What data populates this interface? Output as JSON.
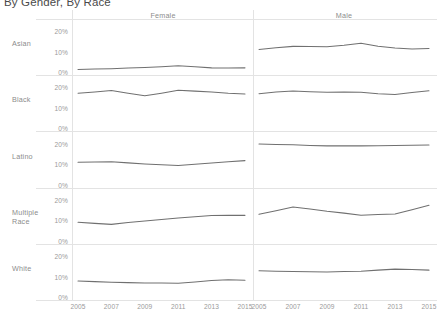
{
  "title": "By Gender, By Race",
  "axis": {
    "y_ticks": [
      "20%",
      "10%",
      "0%"
    ],
    "x_ticks": [
      "2005",
      "2007",
      "2009",
      "2011",
      "2013",
      "2015"
    ]
  },
  "columns": [
    {
      "label": "Female"
    },
    {
      "label": "Male"
    }
  ],
  "rows": [
    {
      "label": "Asian"
    },
    {
      "label": "Black"
    },
    {
      "label": "Latino"
    },
    {
      "label": "Multiple Race"
    },
    {
      "label": "White"
    }
  ],
  "chart_data": {
    "type": "line",
    "title": "By Gender, By Race",
    "xlabel": "",
    "ylabel": "",
    "ylim": [
      0,
      25
    ],
    "grid": false,
    "legend": null,
    "layout": {
      "kind": "small-multiples-trellis",
      "columns": [
        "Female",
        "Male"
      ],
      "rows": [
        "Asian",
        "Black",
        "Latino",
        "Multiple Race",
        "White"
      ],
      "y_tick_values": [
        0,
        10,
        20
      ],
      "y_tick_labels": [
        "0%",
        "10%",
        "20%"
      ],
      "x_tick_labels": [
        "2005",
        "2007",
        "2009",
        "2011",
        "2013",
        "2015"
      ]
    },
    "x": [
      2005,
      2006,
      2007,
      2008,
      2009,
      2010,
      2011,
      2012,
      2013,
      2014,
      2015
    ],
    "series": [
      {
        "name": "Asian - Female",
        "row": "Asian",
        "column": "Female",
        "values": [
          1.8,
          2.0,
          2.2,
          2.5,
          2.8,
          3.2,
          3.6,
          3.1,
          2.6,
          2.5,
          2.6
        ]
      },
      {
        "name": "Asian - Male",
        "row": "Asian",
        "column": "Male",
        "values": [
          11.6,
          12.4,
          13.1,
          13.0,
          12.9,
          13.6,
          14.6,
          13.2,
          12.3,
          11.8,
          12.1
        ]
      },
      {
        "name": "Black - Female",
        "row": "Black",
        "column": "Female",
        "values": [
          17.6,
          18.2,
          18.9,
          17.6,
          16.3,
          17.6,
          19.0,
          18.6,
          18.2,
          17.6,
          17.2
        ]
      },
      {
        "name": "Black - Male",
        "row": "Black",
        "column": "Male",
        "values": [
          17.3,
          18.2,
          18.7,
          18.3,
          18.0,
          18.1,
          18.0,
          17.3,
          16.9,
          17.9,
          18.8
        ]
      },
      {
        "name": "Latino - Female",
        "row": "Latino",
        "column": "Female",
        "values": [
          11.2,
          11.3,
          11.4,
          10.9,
          10.4,
          10.0,
          9.6,
          10.2,
          10.8,
          11.4,
          12.0
        ]
      },
      {
        "name": "Latino - Male",
        "row": "Latino",
        "column": "Male",
        "values": [
          20.1,
          19.9,
          19.7,
          19.4,
          19.2,
          19.2,
          19.2,
          19.3,
          19.4,
          19.5,
          19.6
        ]
      },
      {
        "name": "Multiple Race - Female",
        "row": "Multiple Race",
        "column": "Female",
        "values": [
          9.7,
          9.2,
          8.7,
          9.6,
          10.4,
          11.1,
          11.8,
          12.4,
          13.0,
          13.1,
          13.1
        ]
      },
      {
        "name": "Multiple Race - Male",
        "row": "Multiple Race",
        "column": "Male",
        "values": [
          13.6,
          15.4,
          17.2,
          16.2,
          15.1,
          14.2,
          13.2,
          13.5,
          13.8,
          15.9,
          18.0
        ]
      },
      {
        "name": "White - Female",
        "row": "White",
        "column": "Female",
        "values": [
          8.4,
          8.1,
          7.8,
          7.6,
          7.4,
          7.4,
          7.3,
          7.9,
          8.6,
          9.0,
          8.8
        ]
      },
      {
        "name": "White - Male",
        "row": "White",
        "column": "Male",
        "values": [
          13.4,
          13.2,
          13.0,
          12.9,
          12.8,
          13.0,
          13.2,
          13.7,
          14.2,
          14.0,
          13.7
        ]
      }
    ]
  }
}
